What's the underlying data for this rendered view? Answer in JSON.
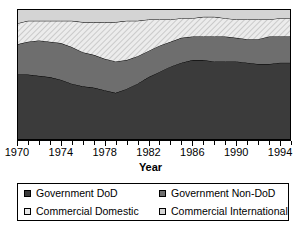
{
  "chart_data": {
    "type": "area",
    "stacked": true,
    "title": "",
    "xlabel": "Year",
    "ylabel": "",
    "grid": false,
    "legend_position": "bottom",
    "xlim": [
      1970,
      1995
    ],
    "ylim": [
      0,
      100
    ],
    "x": [
      1970,
      1971,
      1972,
      1973,
      1974,
      1975,
      1976,
      1977,
      1978,
      1979,
      1980,
      1981,
      1982,
      1983,
      1984,
      1985,
      1986,
      1987,
      1988,
      1989,
      1990,
      1991,
      1992,
      1993,
      1994,
      1995
    ],
    "tick_labels": [
      "1970",
      "1974",
      "1978",
      "1982",
      "1986",
      "1990",
      "1994"
    ],
    "tick_values": [
      1970,
      1974,
      1978,
      1982,
      1986,
      1990,
      1994
    ],
    "series": [
      {
        "name": "Government DoD",
        "color": "#3b3b3b",
        "pattern": "solid",
        "values": [
          50,
          50,
          49,
          48,
          46,
          43,
          41,
          40,
          38,
          36,
          39,
          43,
          48,
          52,
          56,
          59,
          61,
          61,
          60,
          60,
          60,
          59,
          58,
          58,
          59,
          59
        ]
      },
      {
        "name": "Government Non-DoD",
        "color": "#6e6e6e",
        "pattern": "solid",
        "values": [
          23,
          25,
          27,
          27,
          28,
          28,
          26,
          25,
          24,
          24,
          22,
          21,
          20,
          20,
          19,
          19,
          18,
          18,
          19,
          19,
          18,
          18,
          19,
          21,
          20,
          20
        ]
      },
      {
        "name": "Commercial Domestic",
        "color": "#e8e8e8",
        "pattern": "diagonal-hatch",
        "values": [
          16,
          16,
          15,
          16,
          17,
          20,
          23,
          25,
          28,
          30,
          30,
          27,
          24,
          20,
          17,
          15,
          14,
          15,
          15,
          14,
          14,
          15,
          15,
          13,
          14,
          14
        ]
      },
      {
        "name": "Commercial International",
        "color": "#d4d4d4",
        "pattern": "solid",
        "values": [
          11,
          9,
          9,
          9,
          9,
          9,
          10,
          10,
          10,
          10,
          9,
          9,
          8,
          8,
          8,
          7,
          7,
          6,
          6,
          7,
          8,
          8,
          8,
          8,
          7,
          7
        ]
      }
    ]
  },
  "axis": {
    "x_title": "Year"
  },
  "legend": {
    "items": [
      {
        "label": "Government DoD",
        "swatch": "sw-dod"
      },
      {
        "label": "Government Non-DoD",
        "swatch": "sw-nondod"
      },
      {
        "label": "Commercial Domestic",
        "swatch": "sw-comdom"
      },
      {
        "label": "Commercial International",
        "swatch": "sw-comint"
      }
    ]
  }
}
